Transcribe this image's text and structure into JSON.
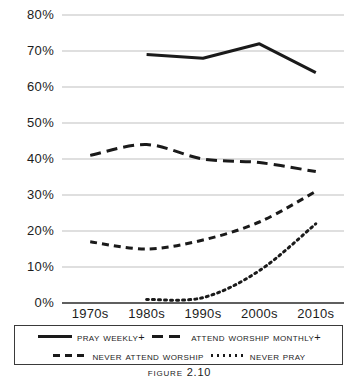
{
  "figure": {
    "caption": "Figure 2.10"
  },
  "axes": {
    "y_tick_labels": [
      "80%",
      "70%",
      "60%",
      "50%",
      "40%",
      "30%",
      "20%",
      "10%",
      "0%"
    ],
    "x_tick_labels": [
      "1970s",
      "1980s",
      "1990s",
      "2000s",
      "2010s"
    ]
  },
  "legend": {
    "rows": [
      [
        {
          "label": "Pray Weekly+",
          "style": "solid",
          "icon": "solid-line-icon"
        },
        {
          "label": "Attend Worship Monthly+",
          "style": "longdash",
          "icon": "long-dash-line-icon"
        }
      ],
      [
        {
          "label": "Never Attend Worship",
          "style": "dash",
          "icon": "dashed-line-icon"
        },
        {
          "label": "Never Pray",
          "style": "dot",
          "icon": "dotted-line-icon"
        }
      ]
    ]
  },
  "chart_data": {
    "type": "line",
    "title": "Figure 2.10",
    "xlabel": "",
    "ylabel": "",
    "categories": [
      "1970s",
      "1980s",
      "1990s",
      "2000s",
      "2010s"
    ],
    "ylim": [
      0,
      80
    ],
    "ytick_step": 10,
    "ytick_format": "percent",
    "grid": true,
    "grid_axis": "y",
    "legend_position": "bottom",
    "line_color": "#1a1a1a",
    "grid_color": "#bfbfbf",
    "series": [
      {
        "name": "Pray Weekly+",
        "style": "solid",
        "values": [
          null,
          69,
          68,
          72,
          64
        ]
      },
      {
        "name": "Attend Worship Monthly+",
        "style": "longdash",
        "values": [
          41,
          44,
          40,
          39,
          36.5
        ]
      },
      {
        "name": "Never Attend Worship",
        "style": "dash",
        "values": [
          17,
          15,
          17.5,
          22.5,
          31
        ]
      },
      {
        "name": "Never Pray",
        "style": "dot",
        "values": [
          null,
          1,
          1.5,
          9,
          22
        ]
      }
    ]
  }
}
